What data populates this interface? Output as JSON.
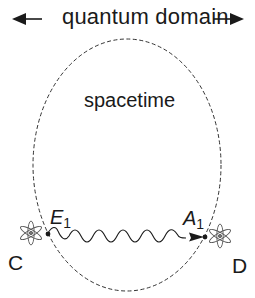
{
  "diagram": {
    "title": "quantum domain",
    "region_label": "spacetime",
    "points": {
      "emitter": {
        "letter": "E",
        "subscript": "1"
      },
      "absorber": {
        "letter": "A",
        "subscript": "1"
      }
    },
    "atoms": {
      "left": "C",
      "right": "D"
    },
    "icons": {
      "left_arrow": "arrow-left-icon",
      "right_arrow": "arrow-right-icon",
      "atom_left": "atom-icon",
      "atom_right": "atom-icon",
      "wave": "photon-wave-icon"
    },
    "colors": {
      "stroke": "#1a1a1a",
      "dash": "#333333",
      "atom": "#555555",
      "background": "#ffffff"
    }
  }
}
